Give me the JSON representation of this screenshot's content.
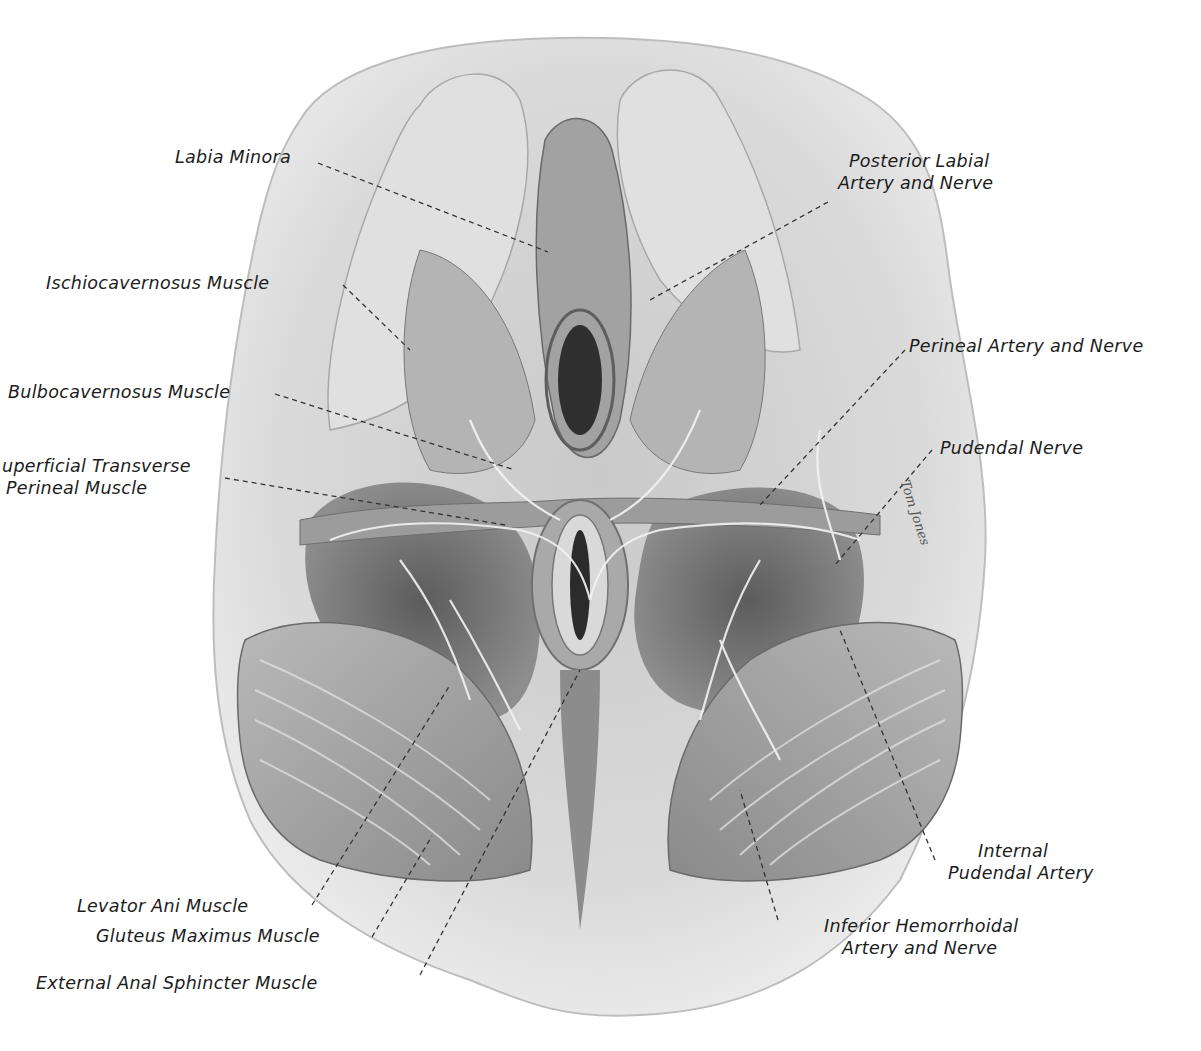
{
  "figure": {
    "type": "anatomical-illustration",
    "palette": {
      "background": "#ffffff",
      "skin_light": "#e4e4e4",
      "skin_mid": "#cfcfcf",
      "muscle_mid": "#9d9d9d",
      "muscle_dark": "#6f6f6f",
      "cavity_dark": "#3a3a3a",
      "vessel_light": "#f2f2f2",
      "label_text": "#1c1c1c",
      "leader_line": "#333333"
    },
    "signature": "Tom Jones"
  },
  "labels": {
    "labia_minora": {
      "lines": [
        "Labia Minora"
      ]
    },
    "posterior_labial": {
      "lines": [
        "Posterior Labial",
        "Artery and Nerve"
      ]
    },
    "ischiocavernosus": {
      "lines": [
        "Ischiocavernosus Muscle"
      ]
    },
    "perineal_artery": {
      "lines": [
        "Perineal Artery and Nerve"
      ]
    },
    "bulbocavernosus": {
      "lines": [
        "Bulbocavernosus Muscle"
      ]
    },
    "pudendal_nerve": {
      "lines": [
        "Pudendal Nerve"
      ]
    },
    "superficial_transverse": {
      "lines": [
        "uperficial Transverse",
        "Perineal Muscle"
      ]
    },
    "internal_pudendal": {
      "lines": [
        "Internal",
        "Pudendal Artery"
      ]
    },
    "levator_ani": {
      "lines": [
        "Levator Ani Muscle"
      ]
    },
    "gluteus_maximus": {
      "lines": [
        "Gluteus Maximus Muscle"
      ]
    },
    "inferior_hemorrhoidal": {
      "lines": [
        "Inferior Hemorrhoidal",
        "Artery and Nerve"
      ]
    },
    "external_anal_sphincter": {
      "lines": [
        "External Anal Sphincter Muscle"
      ]
    }
  }
}
